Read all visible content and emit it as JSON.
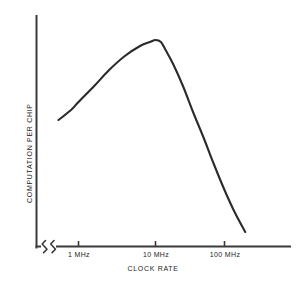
{
  "chart_data": {
    "type": "line",
    "title": "",
    "subtitle": "",
    "xlabel": "CLOCK RATE",
    "ylabel": "COMPUTATION PER CHIP",
    "x_scale": "log",
    "x_axis_break": true,
    "x_tick_labels": [
      "1 MHz",
      "10 MHz",
      "100 MHz"
    ],
    "x_tick_values": [
      1,
      10,
      100
    ],
    "x_tick_units": "MHz",
    "y_tick_labels": [],
    "y_axis_values_shown": false,
    "grid": false,
    "legend": null,
    "annotations": [],
    "series": [
      {
        "name": "computation per chip",
        "x": [
          0.55,
          0.8,
          1.0,
          1.6,
          2.5,
          4.0,
          6.3,
          8.5,
          10.0,
          12.0,
          14.0,
          18.0,
          25.0,
          35.0,
          50.0,
          70.0,
          100.0,
          140.0,
          200.0
        ],
        "y": [
          0.6,
          0.65,
          0.69,
          0.77,
          0.85,
          0.92,
          0.97,
          0.99,
          1.0,
          0.99,
          0.95,
          0.88,
          0.77,
          0.64,
          0.51,
          0.38,
          0.25,
          0.14,
          0.04
        ],
        "y_units": "arbitrary (relative)",
        "color": "#2b2b2b"
      }
    ],
    "x_range_described": "from below 1 MHz (after axis break) to beyond 100 MHz",
    "y_range_described": "unlabeled relative scale, rises to a peak near 10 MHz then falls steeply"
  },
  "axes": {
    "x_axis_label": "CLOCK RATE",
    "y_axis_label": "COMPUTATION PER CHIP",
    "break_symbol": "axis-break-zigzag"
  },
  "ticks": [
    {
      "label": "1 MHz"
    },
    {
      "label": "10 MHz"
    },
    {
      "label": "100 MHz"
    }
  ],
  "colors": {
    "background": "#ffffff",
    "axis": "#3a3a3a",
    "curve": "#2b2b2b",
    "text": "#1c1c1c"
  }
}
